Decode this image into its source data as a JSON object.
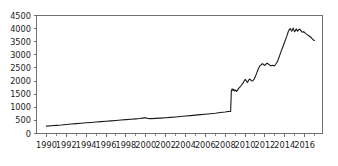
{
  "chart_data": {
    "type": "line",
    "title": "",
    "xlabel": "",
    "ylabel": "",
    "xlim": [
      1989.0,
      1989.0
    ],
    "ylim": [
      0,
      4500
    ],
    "grid": false,
    "legend": null,
    "y_ticks": [
      0,
      500,
      1000,
      1500,
      2000,
      2500,
      3000,
      3500,
      4000,
      4500
    ],
    "y_tick_labels": [
      "0",
      "500",
      "1000",
      "1500",
      "2000",
      "2500",
      "3000",
      "3500",
      "4000",
      "4500"
    ],
    "x_ticks": [
      1990,
      1992,
      1994,
      1996,
      1998,
      2000,
      2002,
      2004,
      2006,
      2008,
      2010,
      2012,
      2014,
      2016
    ],
    "x_tick_labels": [
      "1990",
      "1992",
      "1994",
      "1996",
      "1998",
      "2000",
      "2002",
      "2004",
      "2006",
      "2008",
      "2010",
      "2012",
      "2014",
      "2016"
    ],
    "x_minor_ticks": [
      1991,
      1993,
      1995,
      1997,
      1999,
      2001,
      2003,
      2005,
      2007,
      2009,
      2011,
      2013,
      2015,
      2017
    ],
    "line_color": "#1a1a1a",
    "axis_color": "#6f6f6f",
    "series": [
      {
        "name": "series-1",
        "x": [
          1990.0,
          1990.5,
          1991.0,
          1991.5,
          1992.0,
          1992.5,
          1993.0,
          1993.5,
          1994.0,
          1994.5,
          1995.0,
          1995.5,
          1996.0,
          1996.5,
          1997.0,
          1997.5,
          1998.0,
          1998.5,
          1999.0,
          1999.4,
          1999.7,
          1999.9,
          2000.0,
          2000.2,
          2000.5,
          2001.0,
          2001.5,
          2002.0,
          2002.5,
          2003.0,
          2003.5,
          2004.0,
          2004.5,
          2005.0,
          2005.5,
          2006.0,
          2006.5,
          2007.0,
          2007.5,
          2008.0,
          2008.3,
          2008.55,
          2008.62,
          2008.7,
          2008.78,
          2008.85,
          2008.95,
          2009.05,
          2009.15,
          2009.25,
          2009.35,
          2009.45,
          2009.55,
          2009.65,
          2009.75,
          2009.85,
          2009.95,
          2010.05,
          2010.15,
          2010.25,
          2010.35,
          2010.45,
          2010.55,
          2010.65,
          2010.75,
          2010.9,
          2011.05,
          2011.2,
          2011.35,
          2011.5,
          2011.62,
          2011.75,
          2011.85,
          2011.95,
          2012.05,
          2012.2,
          2012.35,
          2012.5,
          2012.62,
          2012.75,
          2012.85,
          2012.95,
          2013.05,
          2013.2,
          2013.35,
          2013.5,
          2013.65,
          2013.8,
          2013.95,
          2014.1,
          2014.25,
          2014.35,
          2014.45,
          2014.55,
          2014.62,
          2014.7,
          2014.78,
          2014.85,
          2014.92,
          2015.0,
          2015.08,
          2015.15,
          2015.22,
          2015.3,
          2015.4,
          2015.5,
          2015.6,
          2015.7,
          2015.8,
          2015.9,
          2016.0,
          2016.15,
          2016.3,
          2016.45,
          2016.6,
          2016.75,
          2016.9,
          2017.0
        ],
        "y": [
          280,
          295,
          310,
          325,
          345,
          360,
          378,
          392,
          408,
          422,
          438,
          452,
          468,
          482,
          498,
          512,
          528,
          542,
          558,
          572,
          586,
          596,
          600,
          572,
          566,
          575,
          588,
          600,
          615,
          630,
          648,
          665,
          682,
          700,
          718,
          735,
          755,
          775,
          800,
          822,
          838,
          845,
          1630,
          1700,
          1640,
          1690,
          1620,
          1660,
          1600,
          1655,
          1720,
          1760,
          1800,
          1850,
          1900,
          1960,
          2030,
          2060,
          1990,
          1950,
          2020,
          2080,
          2050,
          2010,
          2000,
          2060,
          2180,
          2330,
          2480,
          2580,
          2620,
          2660,
          2640,
          2600,
          2620,
          2680,
          2650,
          2600,
          2580,
          2600,
          2590,
          2580,
          2620,
          2700,
          2830,
          2990,
          3150,
          3300,
          3450,
          3600,
          3760,
          3880,
          3960,
          4000,
          3960,
          3900,
          3960,
          4020,
          3950,
          3880,
          3930,
          3990,
          3940,
          3900,
          3960,
          3980,
          3930,
          3890,
          3860,
          3880,
          3850,
          3800,
          3760,
          3720,
          3680,
          3620,
          3560,
          3550
        ]
      }
    ]
  }
}
